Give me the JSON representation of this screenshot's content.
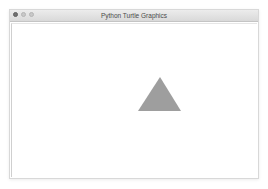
{
  "window": {
    "title": "Python Turtle Graphics",
    "controls": [
      "close-button",
      "minimize-button",
      "zoom-button"
    ]
  },
  "canvas": {
    "background": "#ffffff",
    "shapes": [
      {
        "type": "triangle",
        "fill": "#9e9e9e",
        "points": "148,53 126,87 169,87"
      }
    ]
  }
}
